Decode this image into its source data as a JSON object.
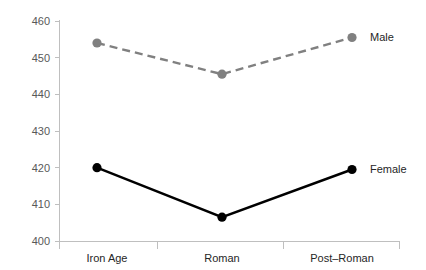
{
  "chart_data": {
    "type": "line",
    "title": "",
    "subtitle": "",
    "xlabel": "",
    "ylabel": "",
    "categories": [
      "Iron Age",
      "Roman",
      "Post–Roman"
    ],
    "ylim": [
      400,
      460
    ],
    "yticks": [
      400,
      410,
      420,
      430,
      440,
      450,
      460
    ],
    "ytick_labels": [
      "400",
      "410",
      "420",
      "430",
      "440",
      "450",
      "460"
    ],
    "grid": false,
    "legend_position": "inline-right",
    "series": [
      {
        "name": "Male",
        "label": "Male",
        "color": "#808080",
        "linestyle": "dashed",
        "marker": "circle",
        "values": [
          454.0,
          445.5,
          455.5
        ]
      },
      {
        "name": "Female",
        "label": "Female",
        "color": "#000000",
        "linestyle": "solid",
        "marker": "circle",
        "values": [
          420.0,
          406.5,
          419.5
        ]
      }
    ]
  },
  "axis": {
    "y_tick_0": "400",
    "y_tick_1": "410",
    "y_tick_2": "420",
    "y_tick_3": "430",
    "y_tick_4": "440",
    "y_tick_5": "450",
    "y_tick_6": "460",
    "cat_0": "Iron Age",
    "cat_1": "Roman",
    "cat_2": "Post–Roman"
  },
  "labels": {
    "male": "Male",
    "female": "Female"
  }
}
